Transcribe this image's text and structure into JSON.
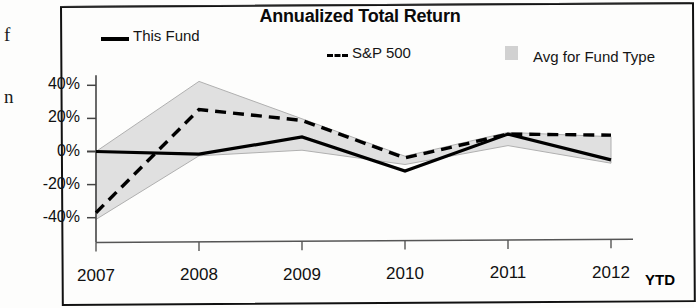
{
  "chart_data": {
    "type": "line",
    "title": "Annualized Total Return",
    "xlabel": "",
    "ylabel": "",
    "categories": [
      "2007",
      "2008",
      "2009",
      "2010",
      "2011",
      "2012"
    ],
    "x_axis_suffix_label": "YTD",
    "ylim": [
      -50,
      45
    ],
    "yticks": [
      40,
      20,
      0,
      -20,
      -40
    ],
    "ytick_labels": [
      "40%",
      "20%",
      "0%",
      "-20%",
      "-40%"
    ],
    "grid": false,
    "legend_position": "top",
    "series": [
      {
        "name": "This Fund",
        "style": "solid",
        "color": "#000000",
        "values": [
          0,
          -2,
          8,
          -13,
          9,
          -7
        ]
      },
      {
        "name": "S&P 500",
        "style": "dashed",
        "color": "#000000",
        "values": [
          -37,
          25,
          18,
          -5,
          9,
          8
        ]
      },
      {
        "name": "Avg for Fund Type",
        "style": "band",
        "color": "#c9c9c9",
        "upper": [
          0,
          42,
          19,
          -4,
          10,
          7
        ],
        "lower": [
          -41,
          -3,
          0,
          -9,
          2,
          -9
        ]
      }
    ]
  },
  "legend": {
    "fund_label": "This Fund",
    "sp_label": "S&P 500",
    "avg_label": "Avg for Fund Type",
    "sp_dash_prefix": "---"
  },
  "margin_text": {
    "top_glyph": "f",
    "bottom_glyph": "n"
  }
}
